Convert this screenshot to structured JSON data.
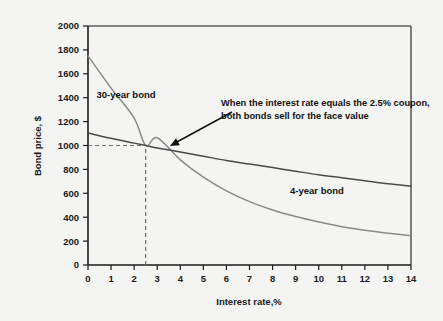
{
  "chart_data": {
    "type": "line",
    "title": "",
    "xlabel": "Interest rate,%",
    "ylabel": "Bond price, $",
    "xlim": [
      0,
      14
    ],
    "ylim": [
      0,
      2000
    ],
    "xticks": [
      "0",
      "1",
      "2",
      "3",
      "4",
      "5",
      "6",
      "7",
      "8",
      "9",
      "10",
      "11",
      "12",
      "13",
      "14"
    ],
    "yticks": [
      "0",
      "200",
      "400",
      "600",
      "800",
      "1000",
      "1200",
      "1400",
      "1600",
      "1800",
      "2000"
    ],
    "grid": false,
    "legend_position": "inline-labels",
    "series": [
      {
        "name": "30-year bond",
        "color": "#8a8a8a",
        "x": [
          0,
          1,
          2,
          2.5,
          3,
          4,
          5,
          6,
          7,
          8,
          9,
          10,
          11,
          12,
          13,
          14
        ],
        "values": [
          1750,
          1480,
          1230,
          1000,
          1065,
          880,
          735,
          620,
          530,
          460,
          405,
          360,
          320,
          290,
          265,
          245
        ]
      },
      {
        "name": "4-year bond",
        "color": "#4a4a4a",
        "x": [
          0,
          1,
          2,
          2.5,
          3,
          4,
          5,
          6,
          7,
          8,
          9,
          10,
          11,
          12,
          13,
          14
        ],
        "values": [
          1105,
          1060,
          1020,
          1000,
          980,
          945,
          910,
          875,
          845,
          815,
          785,
          755,
          730,
          705,
          680,
          660
        ]
      }
    ],
    "intersection": {
      "x": 2.5,
      "y": 1000
    },
    "guide_lines": [
      {
        "type": "horizontal",
        "value": 1000,
        "style": "dashed",
        "from_x": 0,
        "to_x": 2.5
      },
      {
        "type": "vertical",
        "value": 2.5,
        "style": "dashed",
        "from_y": 0,
        "to_y": 1000
      }
    ],
    "annotations": [
      {
        "name": "intersection-note",
        "line1": "When the interest rate equals the 2.5% coupon,",
        "line2": "both bonds sell for the face value",
        "arrow_from": [
          232,
          112
        ],
        "arrow_to": [
          170,
          146
        ]
      }
    ],
    "series_labels": [
      {
        "name": "30-year bond",
        "x": 126,
        "y": 98
      },
      {
        "name": "4-year bond",
        "x": 317,
        "y": 194
      }
    ]
  },
  "axis": {
    "y_title": "Bond price, $",
    "x_title": "Interest rate,%"
  },
  "colors": {
    "background": "#f4f4f2",
    "axis": "#1b1b1b",
    "series_30yr": "#8a8a8a",
    "series_4yr": "#4a4a4a",
    "dashed_guide": "#6f6f6f",
    "text": "#1b1b1b"
  }
}
